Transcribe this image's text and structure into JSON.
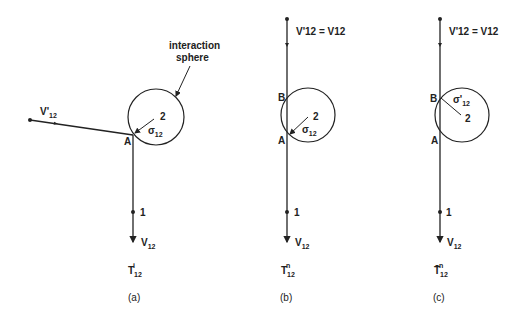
{
  "panels": [
    {
      "id": "a",
      "caption": "(a)",
      "trajectory_label": "T",
      "trajectory_sub": "12",
      "trajectory_sup": "i",
      "incoming_velocity": "V'",
      "incoming_velocity_sub": "12",
      "outgoing_velocity": "V",
      "outgoing_velocity_sub": "12",
      "sphere_label": "interaction sphere",
      "sphere_label_line1": "interaction",
      "sphere_label_line2": "sphere",
      "sigma": "σ",
      "sigma_sub": "12",
      "particle2": "2",
      "particle1": "1",
      "point_A": "A"
    },
    {
      "id": "b",
      "caption": "(b)",
      "trajectory_label": "T",
      "trajectory_sub": "12",
      "trajectory_sup": "n",
      "velocity_eq": "V'12 = V12",
      "sigma": "σ",
      "sigma_sub": "12",
      "particle2": "2",
      "particle1": "1",
      "point_A": "A",
      "point_B": "B",
      "outgoing_velocity": "V",
      "outgoing_velocity_sub": "12"
    },
    {
      "id": "c",
      "caption": "(c)",
      "trajectory_label": "T̄",
      "trajectory_sub": "12",
      "trajectory_sup": "n",
      "velocity_eq": "V'12 = V12",
      "sigma": "σ'",
      "sigma_sub": "12",
      "particle2": "2",
      "particle1": "1",
      "point_A": "A",
      "point_B": "B",
      "outgoing_velocity": "V",
      "outgoing_velocity_sub": "12"
    }
  ]
}
